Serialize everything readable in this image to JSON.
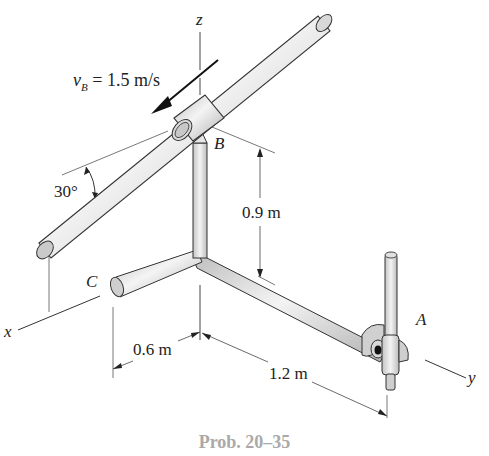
{
  "figure": {
    "caption": "Prob. 20–35",
    "axes": {
      "x": "x",
      "y": "y",
      "z": "z"
    },
    "points": {
      "A": "A",
      "B": "B",
      "C": "C"
    },
    "velocity": {
      "symbol": "v",
      "subscript": "B",
      "value_text": " = 1.5 m/s"
    },
    "angle_label": "30°",
    "dimensions": {
      "height": "0.9 m",
      "x_offset": "0.6 m",
      "y_length": "1.2 m"
    },
    "colors": {
      "rod_fill": "#d6d6d6",
      "rod_highlight": "#f2f2f2",
      "outline": "#3a3a3a",
      "dim_line": "#444444",
      "caption": "#a9a9a9"
    }
  }
}
